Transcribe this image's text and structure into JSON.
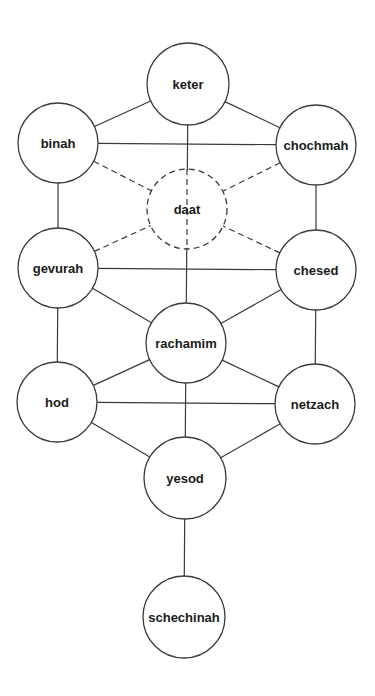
{
  "diagram": {
    "type": "graph",
    "colors": {
      "stroke": "#3a3a3a",
      "text": "#1a1a1a",
      "background": "#ffffff"
    },
    "nodes": [
      {
        "id": "keter",
        "label": "keter",
        "x": 188,
        "y": 84,
        "r": 41,
        "dashed": false
      },
      {
        "id": "binah",
        "label": "binah",
        "x": 58,
        "y": 143,
        "r": 40,
        "dashed": false
      },
      {
        "id": "chochmah",
        "label": "chochmah",
        "x": 316,
        "y": 145,
        "r": 40,
        "dashed": false
      },
      {
        "id": "daat",
        "label": "daat",
        "x": 187,
        "y": 209,
        "r": 40,
        "dashed": true
      },
      {
        "id": "gevurah",
        "label": "gevurah",
        "x": 58,
        "y": 268,
        "r": 40,
        "dashed": false
      },
      {
        "id": "chesed",
        "label": "chesed",
        "x": 316,
        "y": 270,
        "r": 40,
        "dashed": false
      },
      {
        "id": "rachamim",
        "label": "rachamim",
        "x": 186,
        "y": 343,
        "r": 40,
        "dashed": false
      },
      {
        "id": "hod",
        "label": "hod",
        "x": 57,
        "y": 402,
        "r": 40,
        "dashed": false
      },
      {
        "id": "netzach",
        "label": "netzach",
        "x": 315,
        "y": 404,
        "r": 40,
        "dashed": false
      },
      {
        "id": "yesod",
        "label": "yesod",
        "x": 185,
        "y": 478,
        "r": 41,
        "dashed": false
      },
      {
        "id": "schechinah",
        "label": "schechinah",
        "x": 184,
        "y": 617,
        "r": 41,
        "dashed": false
      }
    ],
    "edges": [
      {
        "from": "keter",
        "to": "binah",
        "dashed": false
      },
      {
        "from": "keter",
        "to": "chochmah",
        "dashed": false
      },
      {
        "from": "keter",
        "to": "rachamim",
        "dashed": false
      },
      {
        "from": "binah",
        "to": "chochmah",
        "dashed": false
      },
      {
        "from": "binah",
        "to": "gevurah",
        "dashed": false
      },
      {
        "from": "chochmah",
        "to": "chesed",
        "dashed": false
      },
      {
        "from": "binah",
        "to": "daat",
        "dashed": true
      },
      {
        "from": "chochmah",
        "to": "daat",
        "dashed": true
      },
      {
        "from": "gevurah",
        "to": "daat",
        "dashed": true
      },
      {
        "from": "chesed",
        "to": "daat",
        "dashed": true
      },
      {
        "from": "gevurah",
        "to": "chesed",
        "dashed": false
      },
      {
        "from": "gevurah",
        "to": "rachamim",
        "dashed": false
      },
      {
        "from": "chesed",
        "to": "rachamim",
        "dashed": false
      },
      {
        "from": "gevurah",
        "to": "hod",
        "dashed": false
      },
      {
        "from": "chesed",
        "to": "netzach",
        "dashed": false
      },
      {
        "from": "rachamim",
        "to": "hod",
        "dashed": false
      },
      {
        "from": "rachamim",
        "to": "netzach",
        "dashed": false
      },
      {
        "from": "rachamim",
        "to": "yesod",
        "dashed": false
      },
      {
        "from": "hod",
        "to": "netzach",
        "dashed": false
      },
      {
        "from": "hod",
        "to": "yesod",
        "dashed": false
      },
      {
        "from": "netzach",
        "to": "yesod",
        "dashed": false
      },
      {
        "from": "yesod",
        "to": "schechinah",
        "dashed": false
      }
    ]
  }
}
